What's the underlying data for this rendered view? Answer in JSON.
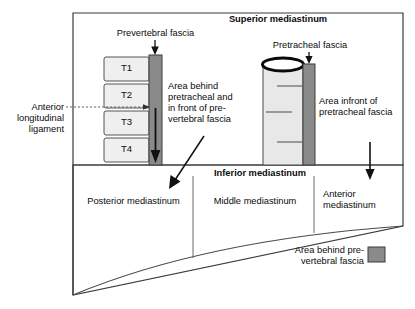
{
  "diagram": {
    "title_superior": "Superior mediastinum",
    "title_inferior": "Inferior mediastinum",
    "labels": {
      "prevertebral_fascia": "Prevertebral fascia",
      "pretracheal_fascia": "Pretracheal fascia",
      "anterior_longitudinal_ligament_l1": "Anterior",
      "anterior_longitudinal_ligament_l2": "longitudinal",
      "anterior_longitudinal_ligament_l3": "ligament",
      "area_behind_l1": "Area behind",
      "area_behind_l2": "pretracheal and",
      "area_behind_l3": "in front of pre-",
      "area_behind_l4": "vertebral fascia",
      "area_infront_l1": "Area infront of",
      "area_infront_l2": "pretracheal fascia",
      "posterior_mediastinum": "Posterior mediastinum",
      "middle_mediastinum": "Middle mediastinum",
      "anterior_mediastinum_l1": "Anterior",
      "anterior_mediastinum_l2": "mediastinum",
      "legend_l1": "Area behind pre-",
      "legend_l2": "vertebral fascia"
    },
    "vertebrae": [
      {
        "label": "T1"
      },
      {
        "label": "T2"
      },
      {
        "label": "T3"
      },
      {
        "label": "T4"
      }
    ],
    "colors": {
      "frame_stroke": "#3a3a3a",
      "fascia_fill": "#8a8a8a",
      "fascia_stroke": "#3c3c3c",
      "vertebra_fill": "#efefef",
      "vertebra_stroke": "#555555",
      "trachea_fill": "#e8e8e8",
      "trachea_stroke": "#4a4a4a",
      "trachea_ring": "#0a0a0a",
      "arrow_dark": "#111111",
      "text": "#0b0b0b",
      "background": "#ffffff"
    }
  }
}
